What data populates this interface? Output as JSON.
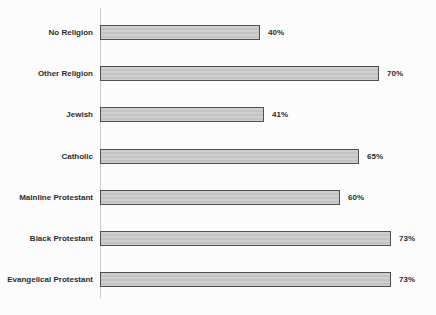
{
  "chart_data": {
    "type": "bar",
    "orientation": "horizontal",
    "title": "",
    "xlabel": "",
    "ylabel": "",
    "categories": [
      "No Religion",
      "Other Religion",
      "Jewish",
      "Catholic",
      "Mainline Protestant",
      "Black Protestant",
      "Evangelical Protestant"
    ],
    "values": [
      40,
      70,
      41,
      65,
      60,
      73,
      73
    ],
    "value_labels": [
      "40%",
      "70%",
      "41%",
      "65%",
      "60%",
      "73%",
      "73%"
    ],
    "xlim": [
      0,
      85
    ],
    "grid": false,
    "legend": false,
    "bar_fill_color": "#c9c9c9",
    "bar_border_color": "#4f4f4f",
    "axis_line_color": "#cdcdcd",
    "text_color": "#2d2d2d",
    "background_color": "#fcfcfc"
  }
}
